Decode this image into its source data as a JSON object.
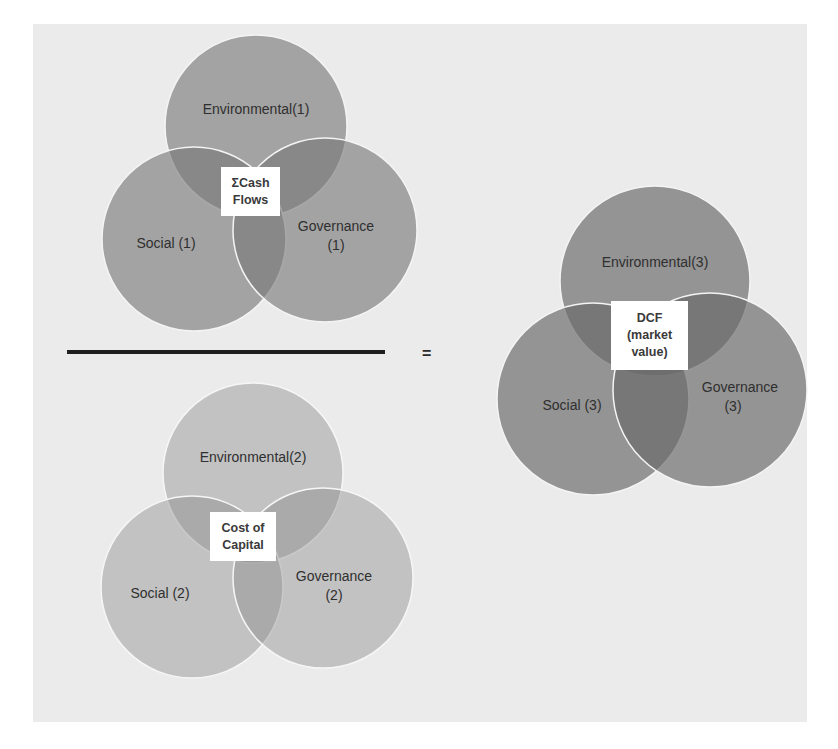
{
  "diagram": {
    "numerator": {
      "title": "ΣCash\nFlows",
      "circles": {
        "environmental": "Environmental(1)",
        "social": "Social (1)",
        "governance_line1": "Governance",
        "governance_line2": "(1)"
      },
      "fill": "#9c9c9c"
    },
    "denominator": {
      "title": "Cost of\nCapital",
      "circles": {
        "environmental": "Environmental(2)",
        "social": "Social (2)",
        "governance_line1": "Governance",
        "governance_line2": "(2)"
      },
      "fill": "#c2c2c2"
    },
    "operator": "=",
    "result": {
      "title": "DCF\n(market\nvalue)",
      "circles": {
        "environmental": "Environmental(3)",
        "social": "Social (3)",
        "governance_line1": "Governance",
        "governance_line2": "(3)"
      },
      "fill": "#8e8e8e"
    }
  },
  "colors": {
    "page_background": "#ebebeb",
    "circle_outline": "#f4f4f4",
    "label_box": "#ffffff",
    "fraction_bar": "#1e1e1e"
  }
}
